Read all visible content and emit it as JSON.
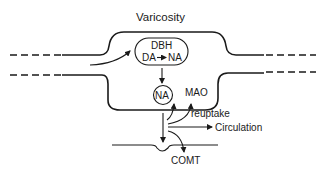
{
  "diagram": {
    "title": "Varicosity",
    "vesicle": {
      "enzyme": "DBH",
      "reaction_from": "DA",
      "reaction_to": "NA"
    },
    "storage_granule": "NA",
    "intracellular_enzyme": "MAO",
    "labels": {
      "reuptake": "reuptake",
      "circulation": "Circulation",
      "extracellular_enzyme": "COMT"
    },
    "colors": {
      "stroke": "#1a1a1a",
      "background": "#ffffff"
    }
  }
}
